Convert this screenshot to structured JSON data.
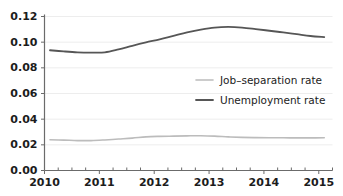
{
  "chart_data": {
    "type": "line",
    "title": "",
    "xlabel": "",
    "ylabel": "",
    "xlim": [
      2010.0,
      2015.25
    ],
    "ylim": [
      0.0,
      0.12
    ],
    "grid": true,
    "grid_axis": "y",
    "legend_position": "center-right-inside",
    "y_ticks": [
      0.0,
      0.02,
      0.04,
      0.06,
      0.08,
      0.1,
      0.12
    ],
    "y_tick_labels": [
      "0.00",
      "0.02",
      "0.04",
      "0.06",
      "0.08",
      "0.10",
      "0.12"
    ],
    "x_ticks": [
      2010,
      2011,
      2012,
      2013,
      2014,
      2015
    ],
    "x_tick_labels": [
      "2010",
      "2011",
      "2012",
      "2013",
      "2014",
      "2015"
    ],
    "x_minor_ticks_per_interval": 4,
    "x": [
      2010.1,
      2010.35,
      2010.6,
      2010.85,
      2011.1,
      2011.35,
      2011.6,
      2011.85,
      2012.1,
      2012.35,
      2012.6,
      2012.85,
      2013.1,
      2013.35,
      2013.6,
      2013.85,
      2014.1,
      2014.35,
      2014.6,
      2014.85,
      2015.1
    ],
    "series": [
      {
        "name": "Job-separation rate",
        "color": "#bcbcbc",
        "width": 1.6,
        "values": [
          0.024,
          0.0237,
          0.0233,
          0.0233,
          0.0238,
          0.0245,
          0.0252,
          0.0262,
          0.0266,
          0.0268,
          0.027,
          0.0271,
          0.0268,
          0.0262,
          0.0258,
          0.0256,
          0.0255,
          0.0255,
          0.0254,
          0.0254,
          0.0255
        ]
      },
      {
        "name": "Unemployment rate",
        "color": "#565656",
        "width": 1.8,
        "values": [
          0.0937,
          0.0928,
          0.0921,
          0.0919,
          0.0921,
          0.0944,
          0.0972,
          0.0998,
          0.1022,
          0.1049,
          0.1076,
          0.1098,
          0.1114,
          0.1119,
          0.1114,
          0.1102,
          0.1089,
          0.1076,
          0.1062,
          0.1048,
          0.104
        ]
      }
    ]
  },
  "legend": {
    "entries": [
      {
        "label": "Job–separation rate",
        "color": "#bcbcbc"
      },
      {
        "label": "Unemployment rate",
        "color": "#565656"
      }
    ]
  },
  "clipped_header": ""
}
